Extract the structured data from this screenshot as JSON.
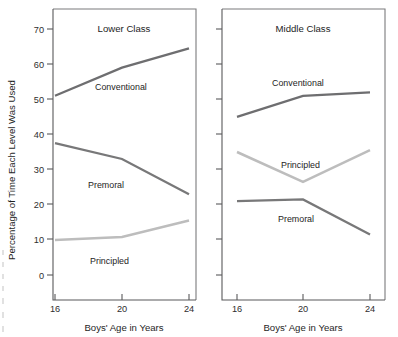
{
  "figure": {
    "y_axis_title": "Percentage Each Level Was Used",
    "y_axis_title_full": "Percentage of Time Each Level Was Used",
    "x_axis_title_left": "Boys' Age in Years",
    "x_axis_title_right": "Boys' Age in Years"
  },
  "axes": {
    "y_ticks": [
      "0",
      "10",
      "20",
      "30",
      "40",
      "50",
      "60",
      "70"
    ],
    "y_tick_values": [
      0,
      10,
      20,
      30,
      40,
      50,
      60,
      70
    ],
    "x_ticks": [
      "16",
      "20",
      "24"
    ],
    "x_tick_values": [
      16,
      20,
      24
    ]
  },
  "colors": {
    "conventional": "#6e6e70",
    "premoral": "#787879",
    "principled": "#bdbdbd",
    "axis": "#59595b",
    "frame": "#7b7b7d",
    "text": "#242424",
    "background": "#ffffff"
  },
  "panels": [
    {
      "title": "Lower Class",
      "series_labels": {
        "conventional": "Conventional",
        "premoral": "Premoral",
        "principled": "Principled"
      }
    },
    {
      "title": "Middle Class",
      "series_labels": {
        "conventional": "Conventional",
        "premoral": "Premoral",
        "principled": "Principled"
      }
    }
  ],
  "chart_data": [
    {
      "type": "line",
      "title": "Lower Class",
      "xlabel": "Boys' Age in Years",
      "ylabel": "Percentage of Time Each Level Was Used",
      "x": [
        16,
        20,
        24
      ],
      "xlim": [
        15,
        25
      ],
      "ylim": [
        -4,
        74
      ],
      "yticks": [
        0,
        10,
        20,
        30,
        40,
        50,
        60,
        70
      ],
      "xticks": [
        16,
        20,
        24
      ],
      "grid": false,
      "legend": "inline-labels",
      "series": [
        {
          "name": "Conventional",
          "values": [
            51,
            59,
            64.5
          ],
          "color": "#6e6e70"
        },
        {
          "name": "Premoral",
          "values": [
            37.5,
            33,
            23
          ],
          "color": "#787879"
        },
        {
          "name": "Principled",
          "values": [
            10,
            10.8,
            15.5
          ],
          "color": "#bdbdbd"
        }
      ]
    },
    {
      "type": "line",
      "title": "Middle Class",
      "xlabel": "Boys' Age in Years",
      "ylabel": "Percentage of Time Each Level Was Used",
      "x": [
        16,
        20,
        24
      ],
      "xlim": [
        15,
        25
      ],
      "ylim": [
        -4,
        74
      ],
      "yticks": [
        0,
        10,
        20,
        30,
        40,
        50,
        60,
        70
      ],
      "xticks": [
        16,
        20,
        24
      ],
      "grid": false,
      "legend": "inline-labels",
      "series": [
        {
          "name": "Conventional",
          "values": [
            45,
            51,
            52
          ],
          "color": "#6e6e70"
        },
        {
          "name": "Principled",
          "values": [
            35,
            26.5,
            35.5
          ],
          "color": "#bdbdbd"
        },
        {
          "name": "Premoral",
          "values": [
            21,
            21.5,
            11.5
          ],
          "color": "#787879"
        }
      ]
    }
  ]
}
